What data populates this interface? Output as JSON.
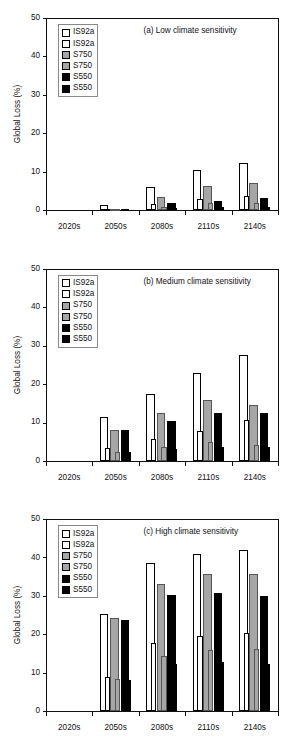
{
  "figure": {
    "ylabel": "Global Loss (%)",
    "ylim": [
      0,
      50
    ],
    "yticks": [
      "0",
      "10",
      "20",
      "30",
      "40",
      "50"
    ],
    "categories": [
      "2020s",
      "2050s",
      "2080s",
      "2110s",
      "2140s"
    ],
    "legend": [
      {
        "label": "IS92a",
        "swatch": "white-square-icon",
        "color": "#ffffff"
      },
      {
        "label": "IS92a",
        "swatch": "white-square-icon",
        "color": "#ffffff"
      },
      {
        "label": "S750",
        "swatch": "gray-square-icon",
        "color": "#a6a6a6"
      },
      {
        "label": "S750",
        "swatch": "gray-square-icon",
        "color": "#a6a6a6"
      },
      {
        "label": "S550",
        "swatch": "black-square-icon",
        "color": "#000000"
      },
      {
        "label": "S550",
        "swatch": "black-square-icon",
        "color": "#000000"
      }
    ]
  },
  "chart_data": [
    {
      "type": "bar",
      "title": "(a) Low climate sensitivity",
      "xlabel": "",
      "ylabel": "Global Loss (%)",
      "ylim": [
        0,
        50
      ],
      "yticks": [
        0,
        10,
        20,
        30,
        40,
        50
      ],
      "grid": false,
      "legend_position": "upper-left",
      "categories": [
        "2020s",
        "2050s",
        "2080s",
        "2110s",
        "2140s"
      ],
      "series": [
        {
          "name": "IS92a",
          "style": "white",
          "values": [
            0.0,
            1.2,
            6.0,
            10.3,
            12.3
          ]
        },
        {
          "name": "IS92a",
          "style": "white",
          "values": [
            0.0,
            0.3,
            1.5,
            2.9,
            3.6
          ]
        },
        {
          "name": "S750",
          "style": "gray",
          "values": [
            0.0,
            0.2,
            3.5,
            6.2,
            7.0
          ]
        },
        {
          "name": "S750",
          "style": "gray",
          "values": [
            0.0,
            0.1,
            0.9,
            1.7,
            1.9
          ]
        },
        {
          "name": "S550",
          "style": "black",
          "values": [
            0.0,
            0.1,
            1.9,
            2.4,
            3.0
          ]
        },
        {
          "name": "S550",
          "style": "black",
          "values": [
            0.0,
            0.0,
            0.5,
            0.9,
            0.8
          ]
        }
      ]
    },
    {
      "type": "bar",
      "title": "(b) Medium climate sensitivity",
      "xlabel": "",
      "ylabel": "Global Loss (%)",
      "ylim": [
        0,
        50
      ],
      "yticks": [
        0,
        10,
        20,
        30,
        40,
        50
      ],
      "grid": false,
      "legend_position": "upper-left",
      "categories": [
        "2020s",
        "2050s",
        "2080s",
        "2110s",
        "2140s"
      ],
      "series": [
        {
          "name": "IS92a",
          "style": "white",
          "values": [
            0.0,
            11.3,
            17.3,
            22.8,
            27.4
          ]
        },
        {
          "name": "IS92a",
          "style": "white",
          "values": [
            0.0,
            3.2,
            5.5,
            7.8,
            10.6
          ]
        },
        {
          "name": "S750",
          "style": "gray",
          "values": [
            0.0,
            7.9,
            12.3,
            15.8,
            14.4
          ]
        },
        {
          "name": "S750",
          "style": "gray",
          "values": [
            0.0,
            2.2,
            3.5,
            4.8,
            4.1
          ]
        },
        {
          "name": "S550",
          "style": "black",
          "values": [
            0.0,
            7.9,
            10.3,
            12.3,
            12.3
          ]
        },
        {
          "name": "S550",
          "style": "black",
          "values": [
            0.0,
            2.2,
            2.9,
            3.5,
            3.5
          ]
        }
      ]
    },
    {
      "type": "bar",
      "title": "(c) High climate sensitivity",
      "xlabel": "",
      "ylabel": "Global Loss (%)",
      "ylim": [
        0,
        50
      ],
      "yticks": [
        0,
        10,
        20,
        30,
        40,
        50
      ],
      "grid": false,
      "legend_position": "upper-left",
      "categories": [
        "2020s",
        "2050s",
        "2080s",
        "2110s",
        "2140s"
      ],
      "series": [
        {
          "name": "IS92a",
          "style": "white",
          "values": [
            0.0,
            25.3,
            38.5,
            40.9,
            42.0
          ]
        },
        {
          "name": "IS92a",
          "style": "white",
          "values": [
            0.0,
            9.0,
            17.8,
            19.6,
            20.4
          ]
        },
        {
          "name": "S750",
          "style": "gray",
          "values": [
            0.0,
            24.3,
            33.1,
            35.6,
            35.7
          ]
        },
        {
          "name": "S750",
          "style": "gray",
          "values": [
            0.0,
            8.3,
            14.3,
            15.9,
            16.1
          ]
        },
        {
          "name": "S550",
          "style": "black",
          "values": [
            0.0,
            23.7,
            30.2,
            30.7,
            30.0
          ]
        },
        {
          "name": "S550",
          "style": "black",
          "values": [
            0.0,
            8.0,
            12.3,
            12.7,
            12.2
          ]
        }
      ]
    }
  ]
}
